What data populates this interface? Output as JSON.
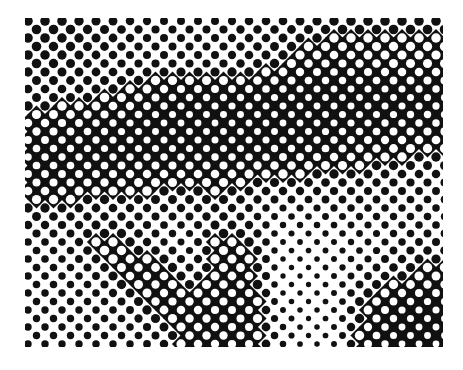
{
  "image": {
    "description": "Black and white halftone dot photograph fragment",
    "width": 463,
    "height": 370,
    "area": {
      "x": 25,
      "y": 18,
      "w": 418,
      "h": 329
    },
    "colors": {
      "ink": "#111111",
      "paper": "#ffffff"
    },
    "dot_pitch_x": 17,
    "dot_pitch_y": 8.5,
    "tone_grid_cols": 14,
    "tone_grid_rows": 11,
    "tone_grid": [
      [
        0.5,
        0.5,
        0.45,
        0.4,
        0.35,
        0.35,
        0.35,
        0.4,
        0.4,
        0.45,
        0.5,
        0.5,
        0.5,
        0.5
      ],
      [
        0.5,
        0.45,
        0.4,
        0.35,
        0.35,
        0.35,
        0.35,
        0.4,
        0.5,
        0.6,
        0.65,
        0.6,
        0.55,
        0.55
      ],
      [
        0.4,
        0.4,
        0.45,
        0.55,
        0.65,
        0.7,
        0.7,
        0.7,
        0.72,
        0.75,
        0.75,
        0.75,
        0.75,
        0.72
      ],
      [
        0.6,
        0.65,
        0.7,
        0.72,
        0.75,
        0.75,
        0.75,
        0.75,
        0.75,
        0.75,
        0.72,
        0.72,
        0.7,
        0.7
      ],
      [
        0.7,
        0.72,
        0.72,
        0.72,
        0.72,
        0.72,
        0.72,
        0.72,
        0.7,
        0.7,
        0.65,
        0.6,
        0.55,
        0.5
      ],
      [
        0.65,
        0.65,
        0.62,
        0.58,
        0.55,
        0.55,
        0.55,
        0.5,
        0.45,
        0.42,
        0.4,
        0.38,
        0.36,
        0.35
      ],
      [
        0.45,
        0.4,
        0.38,
        0.35,
        0.35,
        0.35,
        0.4,
        0.3,
        0.25,
        0.25,
        0.28,
        0.3,
        0.3,
        0.3
      ],
      [
        0.32,
        0.3,
        0.55,
        0.5,
        0.3,
        0.25,
        0.55,
        0.5,
        0.18,
        0.18,
        0.2,
        0.25,
        0.3,
        0.35
      ],
      [
        0.32,
        0.3,
        0.35,
        0.65,
        0.62,
        0.35,
        0.55,
        0.6,
        0.15,
        0.15,
        0.2,
        0.3,
        0.45,
        0.55
      ],
      [
        0.3,
        0.3,
        0.3,
        0.35,
        0.65,
        0.62,
        0.65,
        0.68,
        0.18,
        0.15,
        0.2,
        0.55,
        0.7,
        0.72
      ],
      [
        0.3,
        0.3,
        0.3,
        0.3,
        0.35,
        0.6,
        0.62,
        0.65,
        0.25,
        0.15,
        0.2,
        0.65,
        0.75,
        0.75
      ]
    ]
  }
}
